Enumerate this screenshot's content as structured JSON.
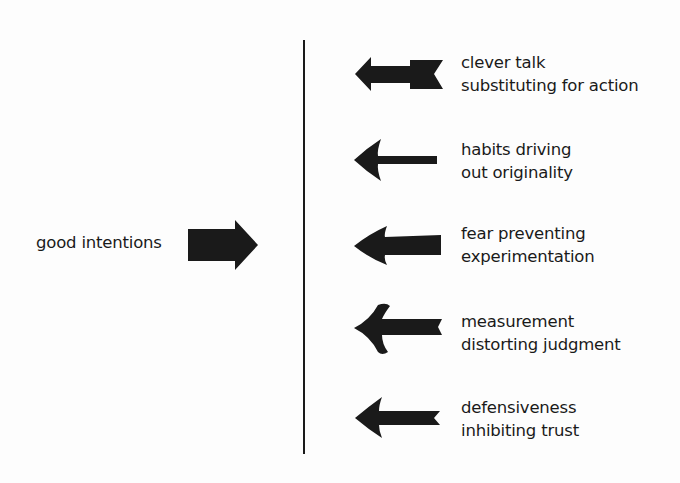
{
  "diagram": {
    "type": "force-field",
    "colors": {
      "ink": "#1a1a1a",
      "background": "#fdfdfd"
    },
    "source": {
      "label": "good intentions",
      "arrow_direction": "right"
    },
    "divider": "vertical-line",
    "opposing_forces": [
      {
        "line1": "clever talk",
        "line2": "substituting for action",
        "arrow_direction": "left",
        "arrow_style": "fletched-thick"
      },
      {
        "line1": "habits driving",
        "line2": "out originality",
        "arrow_direction": "left",
        "arrow_style": "thin-shaft"
      },
      {
        "line1": "fear preventing",
        "line2": "experimentation",
        "arrow_direction": "left",
        "arrow_style": "thick-shaft"
      },
      {
        "line1": "measurement",
        "line2": "distorting judgment",
        "arrow_direction": "left",
        "arrow_style": "curved-head-notched"
      },
      {
        "line1": "defensiveness",
        "line2": "inhibiting trust",
        "arrow_direction": "left",
        "arrow_style": "notched-tail"
      }
    ]
  }
}
